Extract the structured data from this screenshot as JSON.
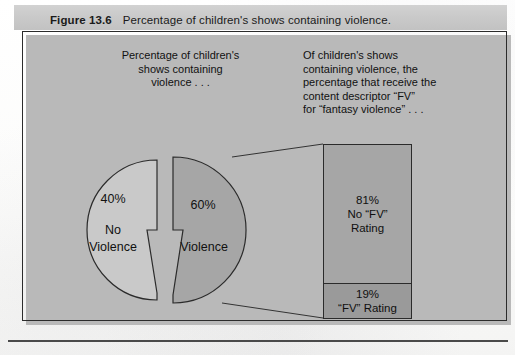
{
  "caption": {
    "label": "Figure 13.6",
    "title": "Percentage of children's shows containing violence."
  },
  "annotations": {
    "left": "Percentage of children's\nshows containing\nviolence . . .",
    "right": "Of children's shows\ncontaining violence, the\npercentage that receive the\ncontent descriptor “FV”\nfor “fantasy violence” . . ."
  },
  "pie": {
    "slices": [
      {
        "percent_label": "40%",
        "name": "No\nViolence",
        "value": 40,
        "color": "#c9c9c9"
      },
      {
        "percent_label": "60%",
        "name": "Violence",
        "value": 60,
        "color": "#a6a6a6"
      }
    ]
  },
  "bar": {
    "segments": [
      {
        "percent_label": "81%",
        "name": "No “FV”\nRating",
        "value": 81,
        "color": "#a6a6a6"
      },
      {
        "percent_label": "19%",
        "name": "“FV” Rating",
        "value": 19,
        "color": "#9a9a9a"
      }
    ]
  },
  "chart_data": [
    {
      "type": "pie",
      "title": "Percentage of children's shows containing violence",
      "categories": [
        "No Violence",
        "Violence"
      ],
      "values": [
        40,
        60
      ],
      "labels": [
        "40%",
        "60%"
      ],
      "colors": [
        "#c9c9c9",
        "#a6a6a6"
      ],
      "exploded": true,
      "legend": "none",
      "annotation": "Percentage of children's shows containing violence . . ."
    },
    {
      "type": "bar",
      "subtype": "stacked-100",
      "title": "Of children's shows containing violence, the percentage that receive the content descriptor “FV” for “fantasy violence”",
      "categories": [
        "No “FV” Rating",
        "“FV” Rating"
      ],
      "values": [
        81,
        19
      ],
      "labels": [
        "81%",
        "19%"
      ],
      "colors": [
        "#a6a6a6",
        "#9a9a9a"
      ],
      "ylim": [
        0,
        100
      ],
      "grid": false,
      "legend": "none",
      "source_slice": "Violence (60%)"
    }
  ]
}
